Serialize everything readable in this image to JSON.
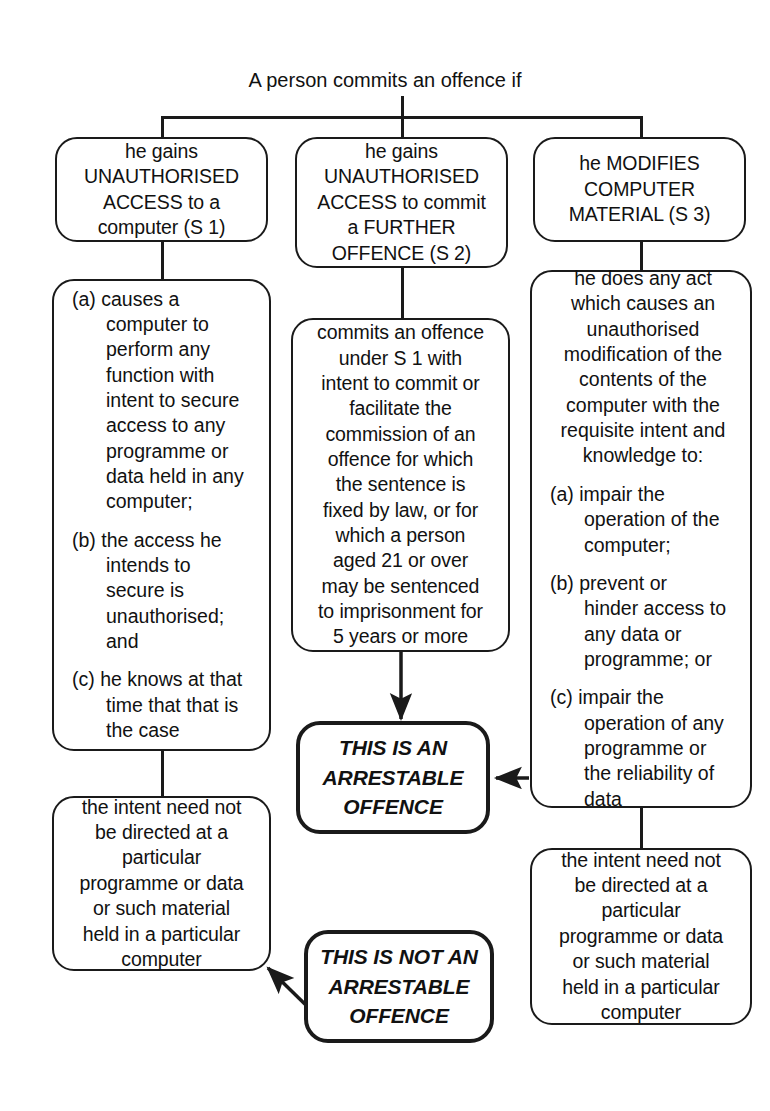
{
  "diagram": {
    "title": "A person commits an offence if",
    "type": "flowchart",
    "colors": {
      "line": "#1a1a1a",
      "text": "#111111",
      "background": "#ffffff"
    }
  },
  "nodes": {
    "s1_head": "he gains\nUNAUTHORISED\nACCESS to a\ncomputer (S 1)",
    "s2_head": "he gains\nUNAUTHORISED\nACCESS to commit\na FURTHER\nOFFENCE (S 2)",
    "s3_head": "he MODIFIES\nCOMPUTER\nMATERIAL (S 3)",
    "s1_clause_a": "(a) causes a\n computer to\n perform any\n function with\n intent to secure\n access to any\n programme or\n data held in any\n computer;",
    "s1_clause_b": "(b) the access he\n intends to\n secure is\n unauthorised;\n and",
    "s1_clause_c": "(c) he knows at that\n time that that is\n the case",
    "s2_body": "commits an offence\nunder S 1 with\nintent to commit or\nfacilitate the\ncommission of an\noffence for which\nthe sentence is\nfixed by law, or for\nwhich a person\naged 21 or over\nmay be sentenced\nto imprisonment for\n5 years or more",
    "s3_lead": "he does any act\nwhich causes an\nunauthorised\nmodification of the\ncontents of the\ncomputer with the\nrequisite intent and\nknowledge to:",
    "s3_clause_a": "(a) impair the\n operation of the\n computer;",
    "s3_clause_b": "(b) prevent or\n hinder access to\n any data or\n programme; or",
    "s3_clause_c": "(c) impair the\n operation of any\n programme or\n the reliability of\n data",
    "intent_left": "the intent need not\nbe directed at a\nparticular\nprogramme or data\nor such material\nheld in a particular\ncomputer",
    "intent_right": "the intent need not\nbe directed at a\nparticular\nprogramme or data\nor such material\nheld in a particular\ncomputer",
    "arrestable": "THIS IS AN\nARRESTABLE\nOFFENCE",
    "not_arrestable": "THIS IS NOT AN\nARRESTABLE\nOFFENCE"
  }
}
